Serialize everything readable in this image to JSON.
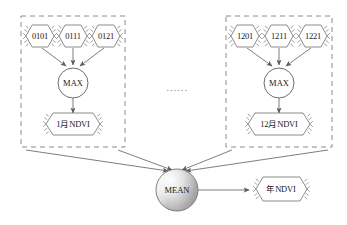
{
  "diagram": {
    "background": "#ffffff",
    "stroke_color": "#6e6e6e",
    "dash_color": "#8a8a8a",
    "text_color": "#1a1a1a",
    "ellipsis": "······",
    "groups": [
      {
        "id": "group-january",
        "box": {
          "x": 21,
          "y": 16,
          "w": 104,
          "h": 131
        },
        "inputs": [
          {
            "id": "input-0101",
            "label": "0101",
            "cx": 40,
            "cy": 36
          },
          {
            "id": "input-0111",
            "label": "0111",
            "cx": 73,
            "cy": 36
          },
          {
            "id": "input-0121",
            "label": "0121",
            "cx": 106,
            "cy": 36
          }
        ],
        "operator": {
          "id": "max-january",
          "label": "MAX",
          "cx": 73,
          "cy": 83,
          "r": 15
        },
        "output": {
          "id": "ndvi-january",
          "label": "1月NDVI",
          "cx": 73,
          "cy": 124
        }
      },
      {
        "id": "group-december",
        "box": {
          "x": 226,
          "y": 16,
          "w": 106,
          "h": 131
        },
        "inputs": [
          {
            "id": "input-1201",
            "label": "1201",
            "cx": 245,
            "cy": 36
          },
          {
            "id": "input-1211",
            "label": "1211",
            "cx": 279,
            "cy": 36
          },
          {
            "id": "input-1221",
            "label": "1221",
            "cx": 313,
            "cy": 36
          }
        ],
        "operator": {
          "id": "max-december",
          "label": "MAX",
          "cx": 279,
          "cy": 83,
          "r": 15
        },
        "output": {
          "id": "ndvi-december",
          "label": "12月NDVI",
          "cx": 279,
          "cy": 124
        }
      }
    ],
    "aggregator": {
      "id": "mean-node",
      "label": "MEAN",
      "cx": 177,
      "cy": 190,
      "r": 21
    },
    "final_output": {
      "id": "ndvi-annual",
      "label": "年NDVI",
      "cx": 281,
      "cy": 189
    }
  }
}
